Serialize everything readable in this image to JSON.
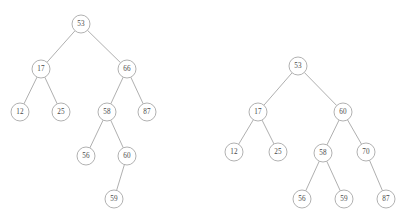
{
  "diagram": {
    "type": "binary-search-tree-pair",
    "node_radius": 9,
    "colors": {
      "background": "#ffffff",
      "node_fill": "#ffffff",
      "node_stroke": "#9d9d9d",
      "edge_stroke": "#9a9a9a",
      "label_color": "#4a4a4a"
    },
    "trees": [
      {
        "name": "tree-left",
        "root": "53",
        "nodes": [
          {
            "id": "L53",
            "label": "53",
            "x": 81,
            "y": 24
          },
          {
            "id": "L17",
            "label": "17",
            "x": 41,
            "y": 69
          },
          {
            "id": "L66",
            "label": "66",
            "x": 127,
            "y": 69
          },
          {
            "id": "L12",
            "label": "12",
            "x": 20,
            "y": 112
          },
          {
            "id": "L25",
            "label": "25",
            "x": 61,
            "y": 112
          },
          {
            "id": "L58",
            "label": "58",
            "x": 107,
            "y": 112
          },
          {
            "id": "L87",
            "label": "87",
            "x": 147,
            "y": 112
          },
          {
            "id": "L56",
            "label": "56",
            "x": 86,
            "y": 156
          },
          {
            "id": "L60",
            "label": "60",
            "x": 127,
            "y": 156
          },
          {
            "id": "L59",
            "label": "59",
            "x": 114,
            "y": 199
          }
        ],
        "edges": [
          {
            "from": "L53",
            "to": "L17"
          },
          {
            "from": "L53",
            "to": "L66"
          },
          {
            "from": "L17",
            "to": "L12"
          },
          {
            "from": "L17",
            "to": "L25"
          },
          {
            "from": "L66",
            "to": "L58"
          },
          {
            "from": "L66",
            "to": "L87"
          },
          {
            "from": "L58",
            "to": "L56"
          },
          {
            "from": "L58",
            "to": "L60"
          },
          {
            "from": "L60",
            "to": "L59"
          }
        ]
      },
      {
        "name": "tree-right",
        "root": "53",
        "nodes": [
          {
            "id": "R53",
            "label": "53",
            "x": 298,
            "y": 66
          },
          {
            "id": "R17",
            "label": "17",
            "x": 258,
            "y": 112
          },
          {
            "id": "R60",
            "label": "60",
            "x": 343,
            "y": 112
          },
          {
            "id": "R12",
            "label": "12",
            "x": 234,
            "y": 152
          },
          {
            "id": "R25",
            "label": "25",
            "x": 278,
            "y": 152
          },
          {
            "id": "R58",
            "label": "58",
            "x": 323,
            "y": 153
          },
          {
            "id": "R70",
            "label": "70",
            "x": 366,
            "y": 152
          },
          {
            "id": "R56",
            "label": "56",
            "x": 302,
            "y": 199
          },
          {
            "id": "R59",
            "label": "59",
            "x": 344,
            "y": 199
          },
          {
            "id": "R87",
            "label": "87",
            "x": 386,
            "y": 199
          }
        ],
        "edges": [
          {
            "from": "R53",
            "to": "R17"
          },
          {
            "from": "R53",
            "to": "R60"
          },
          {
            "from": "R17",
            "to": "R12"
          },
          {
            "from": "R17",
            "to": "R25"
          },
          {
            "from": "R60",
            "to": "R58"
          },
          {
            "from": "R60",
            "to": "R70"
          },
          {
            "from": "R58",
            "to": "R56"
          },
          {
            "from": "R58",
            "to": "R59"
          },
          {
            "from": "R70",
            "to": "R87"
          }
        ]
      }
    ]
  }
}
